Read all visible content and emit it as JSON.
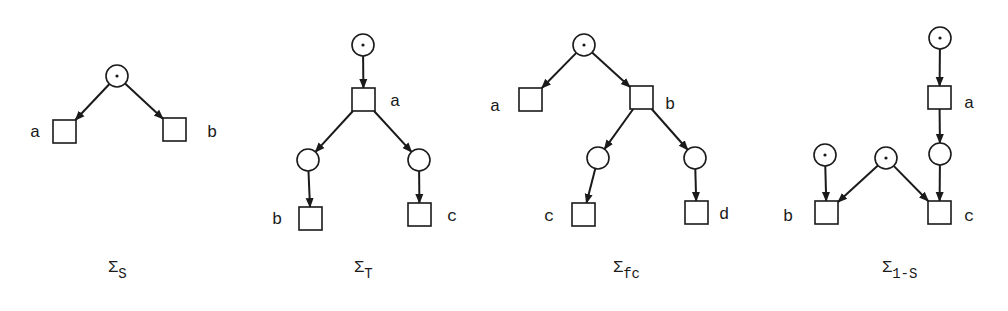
{
  "nets": [
    {
      "id": "sigma-s",
      "caption": {
        "main": "Σ",
        "sub": "S",
        "x": 108,
        "y": 272
      },
      "places": [
        {
          "id": "p0",
          "cx": 117,
          "cy": 76,
          "token": true
        }
      ],
      "transitions": [
        {
          "id": "a",
          "label": "a",
          "x": 53,
          "y": 120,
          "lx": 30,
          "ly": 137
        },
        {
          "id": "b",
          "label": "b",
          "x": 163,
          "y": 118,
          "lx": 207,
          "ly": 137
        }
      ],
      "arcs": [
        {
          "from": "p0",
          "to": "a"
        },
        {
          "from": "p0",
          "to": "b"
        }
      ]
    },
    {
      "id": "sigma-t",
      "caption": {
        "main": "Σ",
        "sub": "T",
        "x": 354,
        "y": 272
      },
      "places": [
        {
          "id": "p0",
          "cx": 363,
          "cy": 45,
          "token": true
        },
        {
          "id": "p1",
          "cx": 308,
          "cy": 160,
          "token": false
        },
        {
          "id": "p2",
          "cx": 419,
          "cy": 160,
          "token": false
        }
      ],
      "transitions": [
        {
          "id": "a",
          "label": "a",
          "x": 352,
          "y": 88,
          "lx": 390,
          "ly": 106
        },
        {
          "id": "b",
          "label": "b",
          "x": 299,
          "y": 207,
          "lx": 272,
          "ly": 224
        },
        {
          "id": "c",
          "label": "c",
          "x": 408,
          "y": 203,
          "lx": 447,
          "ly": 221
        }
      ],
      "arcs": [
        {
          "from": "p0",
          "to": "a"
        },
        {
          "from": "a",
          "to": "p1"
        },
        {
          "from": "a",
          "to": "p2"
        },
        {
          "from": "p1",
          "to": "b"
        },
        {
          "from": "p2",
          "to": "c"
        }
      ]
    },
    {
      "id": "sigma-fc",
      "caption": {
        "main": "Σ",
        "sub": "fc",
        "x": 613,
        "y": 272
      },
      "places": [
        {
          "id": "p0",
          "cx": 584,
          "cy": 45,
          "token": true
        },
        {
          "id": "p1",
          "cx": 598,
          "cy": 158,
          "token": false
        },
        {
          "id": "p2",
          "cx": 695,
          "cy": 158,
          "token": false
        }
      ],
      "transitions": [
        {
          "id": "a",
          "label": "a",
          "x": 519,
          "y": 88,
          "lx": 490,
          "ly": 111
        },
        {
          "id": "b",
          "label": "b",
          "x": 630,
          "y": 86,
          "lx": 665,
          "ly": 109
        },
        {
          "id": "c",
          "label": "c",
          "x": 572,
          "y": 203,
          "lx": 544,
          "ly": 221
        },
        {
          "id": "d",
          "label": "d",
          "x": 685,
          "y": 201,
          "lx": 719,
          "ly": 219
        }
      ],
      "arcs": [
        {
          "from": "p0",
          "to": "a"
        },
        {
          "from": "p0",
          "to": "b"
        },
        {
          "from": "b",
          "to": "p1"
        },
        {
          "from": "b",
          "to": "p2"
        },
        {
          "from": "p1",
          "to": "c"
        },
        {
          "from": "p2",
          "to": "d"
        }
      ]
    },
    {
      "id": "sigma-1s",
      "caption": {
        "main": "Σ",
        "sub": "1-S",
        "x": 882,
        "y": 272
      },
      "places": [
        {
          "id": "p0",
          "cx": 940,
          "cy": 38,
          "token": true
        },
        {
          "id": "p1",
          "cx": 940,
          "cy": 154,
          "token": false
        },
        {
          "id": "p2",
          "cx": 825,
          "cy": 155,
          "token": true
        },
        {
          "id": "p3",
          "cx": 886,
          "cy": 158,
          "token": true
        }
      ],
      "transitions": [
        {
          "id": "a",
          "label": "a",
          "x": 928,
          "y": 86,
          "lx": 964,
          "ly": 108
        },
        {
          "id": "b",
          "label": "b",
          "x": 815,
          "y": 201,
          "lx": 783,
          "ly": 221
        },
        {
          "id": "c",
          "label": "c",
          "x": 928,
          "y": 201,
          "lx": 964,
          "ly": 221
        }
      ],
      "arcs": [
        {
          "from": "p0",
          "to": "a"
        },
        {
          "from": "a",
          "to": "p1"
        },
        {
          "from": "p1",
          "to": "c"
        },
        {
          "from": "p2",
          "to": "b"
        },
        {
          "from": "p3",
          "to": "b"
        },
        {
          "from": "p3",
          "to": "c"
        }
      ]
    }
  ],
  "style": {
    "ink": "#1a1a1a",
    "background": "#ffffff",
    "place_radius": 11,
    "transition_size": 23
  }
}
